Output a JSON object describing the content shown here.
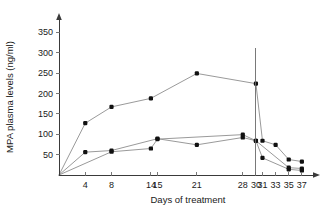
{
  "chart_data": {
    "type": "line",
    "title": "",
    "xlabel": "Days of treatment",
    "ylabel": "MPA plasma levels (ng/ml)",
    "x_tick_labels": [
      "4",
      "8",
      "14",
      "15",
      "21",
      "28",
      "30",
      "31",
      "33",
      "35",
      "37"
    ],
    "x_tick_values": [
      4,
      8,
      14,
      15,
      21,
      28,
      30,
      31,
      33,
      35,
      37
    ],
    "y_tick_labels": [
      "50",
      "100",
      "150",
      "200",
      "250",
      "300",
      "350"
    ],
    "y_tick_values": [
      50,
      100,
      150,
      200,
      250,
      300,
      350
    ],
    "ylim": [
      0,
      385
    ],
    "xlim": [
      0,
      39
    ],
    "grid": false,
    "legend": "none",
    "annotations": [
      {
        "name": "treatment-stop-line",
        "type": "vertical-line",
        "x": 30
      }
    ],
    "series": [
      {
        "name": "patient-1",
        "points": [
          {
            "x": 0,
            "y": 0
          },
          {
            "x": 4,
            "y": 127
          },
          {
            "x": 8,
            "y": 167
          },
          {
            "x": 14,
            "y": 188
          },
          {
            "x": 21,
            "y": 249
          },
          {
            "x": 30,
            "y": 224
          },
          {
            "x": 31,
            "y": 84
          },
          {
            "x": 33,
            "y": 74
          },
          {
            "x": 35,
            "y": 38
          },
          {
            "x": 37,
            "y": 33
          }
        ]
      },
      {
        "name": "patient-2",
        "points": [
          {
            "x": 0,
            "y": 0
          },
          {
            "x": 4,
            "y": 56
          },
          {
            "x": 8,
            "y": 60
          },
          {
            "x": 15,
            "y": 89
          },
          {
            "x": 21,
            "y": 74
          },
          {
            "x": 28,
            "y": 92
          },
          {
            "x": 30,
            "y": 84
          },
          {
            "x": 31,
            "y": 42
          },
          {
            "x": 35,
            "y": 14
          },
          {
            "x": 37,
            "y": 11
          }
        ]
      },
      {
        "name": "patient-3",
        "points": [
          {
            "x": 0,
            "y": 0
          },
          {
            "x": 8,
            "y": 57
          },
          {
            "x": 14,
            "y": 65
          },
          {
            "x": 15,
            "y": 88
          },
          {
            "x": 28,
            "y": 99
          },
          {
            "x": 30,
            "y": 84
          },
          {
            "x": 35,
            "y": 18
          },
          {
            "x": 37,
            "y": 16
          }
        ]
      }
    ],
    "colors": {
      "axis": "#3a3a3a",
      "line": "#9a9a9a",
      "marker": "#111111",
      "text": "#1a1a1a",
      "background": "#ffffff"
    }
  }
}
